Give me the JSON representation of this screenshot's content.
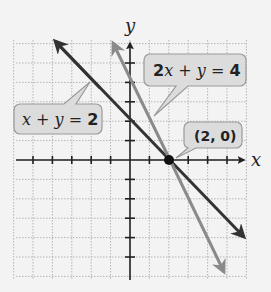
{
  "chart_data": {
    "type": "line",
    "title": "",
    "xlabel": "x",
    "ylabel": "y",
    "xlim": [
      -6,
      6
    ],
    "ylim": [
      -6,
      6
    ],
    "grid": true,
    "series": [
      {
        "name": "x + y = 2",
        "equation": "y = 2 - x",
        "color": "#333333",
        "points": [
          [
            -4,
            6
          ],
          [
            6,
            -4
          ]
        ]
      },
      {
        "name": "2x + y = 4",
        "equation": "y = 4 - 2x",
        "color": "#8a8a8a",
        "points": [
          [
            -1,
            6
          ],
          [
            5,
            -6
          ]
        ]
      }
    ],
    "annotations": [
      {
        "text": "(2, 0)",
        "x": 2,
        "y": 0,
        "type": "intersection-point"
      },
      {
        "text": "x + y = 2",
        "target": "x + y = 2"
      },
      {
        "text": "2x + y = 4",
        "target": "2x + y = 4"
      }
    ]
  },
  "labels": {
    "x_axis": "x",
    "y_axis": "y",
    "line1_label": {
      "var1": "x",
      "op1": " + ",
      "var2": "y",
      "eq": " = ",
      "num": "2"
    },
    "line2_label": {
      "coef": "2",
      "var1": "x",
      "op1": " + ",
      "var2": "y",
      "eq": " = ",
      "num": "4"
    },
    "point_label": "(2, 0)"
  },
  "colors": {
    "line1": "#333333",
    "line2": "#8a8a8a",
    "callout_fill": "#dcdcdc",
    "callout_stroke": "#9a9a9a",
    "grid": "#b5b5b5",
    "axis": "#222222"
  }
}
